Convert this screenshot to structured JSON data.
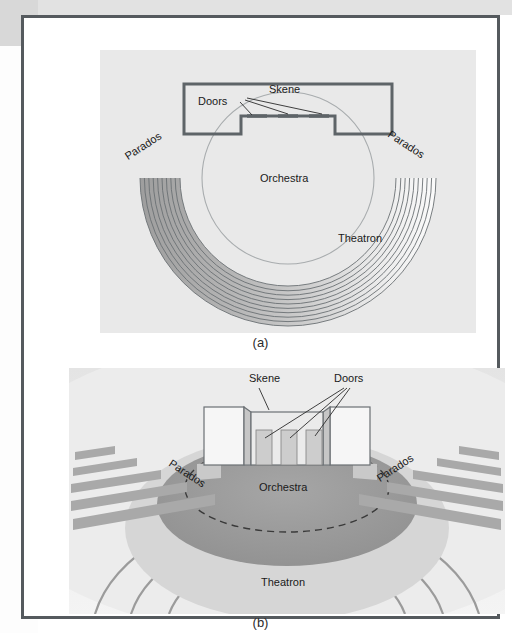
{
  "figure": {
    "panel_a": {
      "caption": "(a)",
      "labels": {
        "skene": "Skene",
        "doors": "Doors",
        "parados_left": "Parados",
        "parados_right": "Parados",
        "orchestra": "Orchestra",
        "theatron": "Theatron"
      },
      "view": "plan view of a Greek theatre",
      "theatron_rows": 10
    },
    "panel_b": {
      "caption": "(b)",
      "labels": {
        "skene": "Skene",
        "doors": "Doors",
        "parados_left": "Parados",
        "parados_right": "Parados",
        "orchestra": "Orchestra",
        "theatron": "Theatron"
      },
      "view": "perspective view of a Greek theatre",
      "door_count": 3,
      "step_count": 5
    }
  },
  "colors": {
    "frame_border": "#555a5e",
    "panel_a_bg": "#e9e9e9",
    "panel_b_bg": "#eeeeee",
    "outline": "#6b7074",
    "seat_dark": "#9a9a9a",
    "seat_light": "#f2f2f2",
    "orchestra_fill": "#9e9e9e",
    "page_bg": "#ffffff",
    "scan_gray": "#d8d8d8",
    "text": "#1a1a1a"
  }
}
